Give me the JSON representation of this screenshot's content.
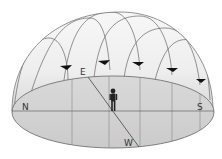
{
  "diagram": {
    "labels": {
      "north": "N",
      "south": "S",
      "east": "E",
      "west": "W"
    },
    "colors": {
      "dome_fill_top": "#f4f4f4",
      "dome_fill_bottom": "#dcdcdc",
      "horizon_fill": "#d2d2d2",
      "line": "#555555",
      "arrow": "#111111",
      "observer": "#222222"
    },
    "elements": {
      "observer": "person standing at center",
      "star_paths_count": 5,
      "direction_arrows_count": 5
    }
  }
}
